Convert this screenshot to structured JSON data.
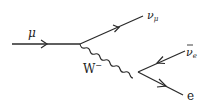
{
  "diagram": {
    "type": "feynman",
    "title": "",
    "colors": {
      "line": "#2a2a2a",
      "text": "#222222",
      "background": "#ffffff"
    },
    "particles": {
      "muon": {
        "symbol": "μ"
      },
      "muon_neutrino": {
        "symbol": "ν",
        "subscript": "μ"
      },
      "w_boson": {
        "symbol": "W",
        "superscript": "−"
      },
      "electron_antineutrino": {
        "symbol": "ν",
        "bar": "‾",
        "subscript": "e"
      },
      "electron": {
        "symbol": "e"
      }
    }
  }
}
